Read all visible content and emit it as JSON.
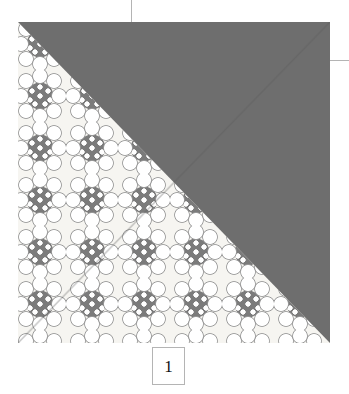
{
  "diagram": {
    "step_label": "1",
    "colors": {
      "solid_fabric": "#6e6e6e",
      "print_background": "#f6f5f1",
      "print_motif": "#7b7b7b",
      "motif_dots": "#ffffff",
      "leader_line": "#b4b4b4",
      "label_border": "#b4b4b4",
      "label_text": "#111111",
      "page_background": "#ffffff"
    },
    "block": {
      "shape": "square",
      "orientation": "half-square-triangle",
      "halves": [
        {
          "name": "solid-half",
          "position": "upper-right",
          "fabric": "solid gray"
        },
        {
          "name": "print-half",
          "position": "lower-left",
          "fabric": "gray floral print on cream",
          "motif": "daisy with dotted center"
        }
      ]
    },
    "callouts": [
      {
        "name": "top-leader",
        "orientation": "vertical"
      },
      {
        "name": "right-leader",
        "orientation": "horizontal"
      }
    ]
  }
}
